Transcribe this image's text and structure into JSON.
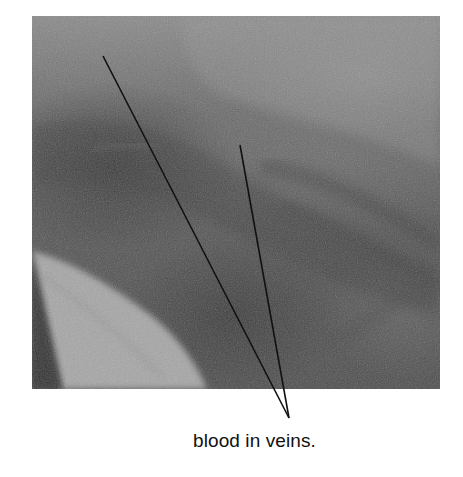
{
  "figure": {
    "type": "annotated-photograph",
    "photo": {
      "description": "grayscale close-up photograph of tissue showing darker vein regions and a lighter wedge-shaped area at lower left",
      "tone": "grayscale"
    },
    "annotation": {
      "label": "blood in veins.",
      "pointer_count": 2,
      "line_color": "#111111"
    }
  }
}
